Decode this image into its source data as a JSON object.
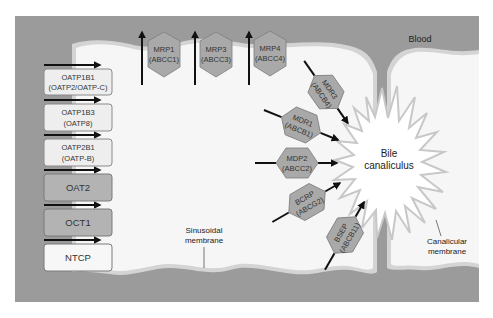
{
  "colors": {
    "blood": "#9b9b9b",
    "cell": "#f6f6f6",
    "membrane_edge": "#d4d4d4",
    "hex_fill": "#a9a9a9",
    "hex_stroke": "#7e7e7e",
    "box_light": "#eeeeee",
    "box_dark": "#b3b3b3",
    "box_white": "#f7f7f7",
    "arrow": "#111111"
  },
  "labels": {
    "blood": "Blood",
    "bile_line1": "Bile",
    "bile_line2": "canaliculus",
    "sinusoidal_line1": "Sinusoidal",
    "sinusoidal_line2": "membrane",
    "canalicular_line1": "Canalicular",
    "canalicular_line2": "membrane"
  },
  "uptake_transporters": [
    {
      "name": "OATP1B1",
      "alias": "(OATP2/OATP-C)",
      "shade": "light"
    },
    {
      "name": "OATP1B3",
      "alias": "(OATP8)",
      "shade": "light"
    },
    {
      "name": "OATP2B1",
      "alias": "(OATP-B)",
      "shade": "light"
    },
    {
      "name": "OAT2",
      "alias": "",
      "shade": "dark"
    },
    {
      "name": "OCT1",
      "alias": "",
      "shade": "dark"
    },
    {
      "name": "NTCP",
      "alias": "",
      "shade": "white"
    }
  ],
  "sinusoidal_efflux": [
    {
      "name": "MRP1",
      "alias": "(ABCC1)"
    },
    {
      "name": "MRP3",
      "alias": "(ABCC3)"
    },
    {
      "name": "MRP4",
      "alias": "(ABCC4)"
    }
  ],
  "canalicular_efflux": [
    {
      "name": "MDR3",
      "alias": "(ABCB4)"
    },
    {
      "name": "MDR1",
      "alias": "(ABCB1)"
    },
    {
      "name": "MDP2",
      "alias": "(ABCC2)"
    },
    {
      "name": "BCRP",
      "alias": "(ABCG2)"
    },
    {
      "name": "BSEP",
      "alias": "(ABCB11)"
    }
  ]
}
